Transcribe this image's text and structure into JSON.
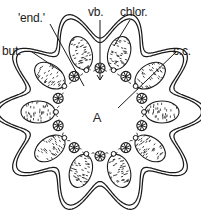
{
  "figure": {
    "type": "botanical-cross-section",
    "medium": "pen-and-ink line drawing",
    "background_color": "#ffffff",
    "ink_color": "#1b1b1b"
  },
  "labels": {
    "endodermis": "'end.'",
    "vascular_bundle": "vb.",
    "chlorenchyma": "chlor.",
    "buttress": "but.",
    "central_cavity": "c.c.",
    "cavity_mark": "A"
  },
  "structures": {
    "outline": {
      "name": "lobed-outer-wall",
      "lobes": 10,
      "stroke_style": "double-line",
      "outer_radius_x": 92,
      "outer_radius_y": 88,
      "lobe_depth": 14
    },
    "chlorenchyma_cells": {
      "name": "stippled-oval",
      "count": 10,
      "fill": "stipple",
      "ring_radius": 62,
      "oval_rx": 11,
      "oval_ry": 17
    },
    "vascular_bundles": {
      "name": "bundle-circle",
      "count": 10,
      "ring_radius": 44,
      "radius": 5,
      "spokes": 8
    },
    "minor_bundles": {
      "name": "small-bundle-dot",
      "count": 10,
      "ring_radius": 44,
      "radius": 2.4
    },
    "endodermis_ring": {
      "name": "dashed-endodermis-ring",
      "radius": 44,
      "stroke_style": "dashed"
    },
    "central_cavity": {
      "name": "central-lacuna",
      "radius": 38
    }
  },
  "leaders": [
    {
      "name": "leader-end",
      "from": [
        50,
        24
      ],
      "to": [
        84,
        86
      ]
    },
    {
      "name": "leader-vb",
      "from": [
        100,
        20
      ],
      "to": [
        100,
        80
      ],
      "arrow": true
    },
    {
      "name": "leader-chlor",
      "from": [
        130,
        20
      ],
      "to": [
        114,
        46
      ]
    },
    {
      "name": "leader-but",
      "from": [
        32,
        52
      ],
      "to": [
        62,
        72
      ]
    },
    {
      "name": "leader-cc",
      "from": [
        176,
        52
      ],
      "to": [
        118,
        108
      ]
    }
  ]
}
